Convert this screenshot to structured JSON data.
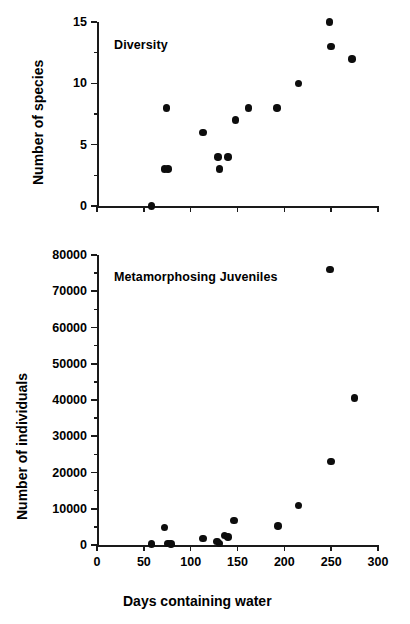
{
  "figure": {
    "background": "#ffffff",
    "marker_color": "#0d0d0d",
    "axis_color": "#1a1a1a"
  },
  "x_axis_title": "Days containing water",
  "chart_data": [
    {
      "type": "scatter",
      "title": "Diversity",
      "xlabel": "",
      "ylabel": "Number of species",
      "xlim": [
        0,
        300
      ],
      "ylim": [
        0,
        15
      ],
      "xticks": [
        0,
        50,
        100,
        150,
        200,
        250,
        300
      ],
      "xticklabels": [
        "",
        "",
        "",
        "",
        "",
        "",
        ""
      ],
      "yticks": [
        0,
        5,
        10,
        15
      ],
      "yticklabels": [
        "0",
        "5",
        "10",
        "15"
      ],
      "y_minor_ticks": [
        2.5,
        7.5,
        12.5
      ],
      "grid": false,
      "legend": "none",
      "points": [
        {
          "x": 58,
          "y": 0
        },
        {
          "x": 72,
          "y": 3
        },
        {
          "x": 76,
          "y": 3
        },
        {
          "x": 74,
          "y": 8
        },
        {
          "x": 113,
          "y": 6
        },
        {
          "x": 129,
          "y": 4
        },
        {
          "x": 131,
          "y": 3
        },
        {
          "x": 140,
          "y": 4
        },
        {
          "x": 148,
          "y": 7
        },
        {
          "x": 162,
          "y": 8
        },
        {
          "x": 192,
          "y": 8
        },
        {
          "x": 215,
          "y": 10
        },
        {
          "x": 248,
          "y": 15
        },
        {
          "x": 250,
          "y": 13
        },
        {
          "x": 272,
          "y": 12
        }
      ]
    },
    {
      "type": "scatter",
      "title": "Metamorphosing Juveniles",
      "xlabel": "Days containing water",
      "ylabel": "Number of individuals",
      "xlim": [
        0,
        300
      ],
      "ylim": [
        0,
        80000
      ],
      "xticks": [
        0,
        50,
        100,
        150,
        200,
        250,
        300
      ],
      "xticklabels": [
        "0",
        "50",
        "100",
        "150",
        "200",
        "250",
        "300"
      ],
      "yticks": [
        0,
        10000,
        20000,
        30000,
        40000,
        50000,
        60000,
        70000,
        80000
      ],
      "yticklabels": [
        "0",
        "10000",
        "20000",
        "30000",
        "40000",
        "50000",
        "60000",
        "70000",
        "80000"
      ],
      "y_minor_ticks": [
        5000,
        15000,
        25000,
        35000,
        45000,
        55000,
        65000,
        75000
      ],
      "grid": false,
      "legend": "none",
      "points": [
        {
          "x": 58,
          "y": 300
        },
        {
          "x": 72,
          "y": 4800
        },
        {
          "x": 76,
          "y": 400
        },
        {
          "x": 79,
          "y": 300
        },
        {
          "x": 113,
          "y": 1800
        },
        {
          "x": 128,
          "y": 900
        },
        {
          "x": 131,
          "y": 400
        },
        {
          "x": 136,
          "y": 2600
        },
        {
          "x": 140,
          "y": 2200
        },
        {
          "x": 146,
          "y": 6800
        },
        {
          "x": 193,
          "y": 5200
        },
        {
          "x": 215,
          "y": 10900
        },
        {
          "x": 249,
          "y": 76000
        },
        {
          "x": 250,
          "y": 23000
        },
        {
          "x": 275,
          "y": 40500
        }
      ]
    }
  ]
}
